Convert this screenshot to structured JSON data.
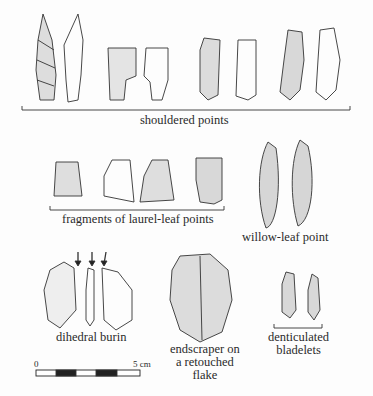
{
  "figure": {
    "groups": [
      {
        "id": "shouldered",
        "label": "shouldered points",
        "count": 8
      },
      {
        "id": "laurel",
        "label": "fragments of laurel-leaf points",
        "count": 4
      },
      {
        "id": "willow",
        "label": "willow-leaf point",
        "count": 2
      },
      {
        "id": "burin",
        "label": "dihedral burin",
        "count": 3
      },
      {
        "id": "endscraper",
        "label_lines": [
          "endscraper on",
          "a retouched",
          "flake"
        ],
        "count": 1
      },
      {
        "id": "bladelets",
        "label_lines": [
          "denticulated",
          "bladelets"
        ],
        "count": 2
      }
    ],
    "scale": {
      "start": "0",
      "end": "5 cm"
    }
  }
}
